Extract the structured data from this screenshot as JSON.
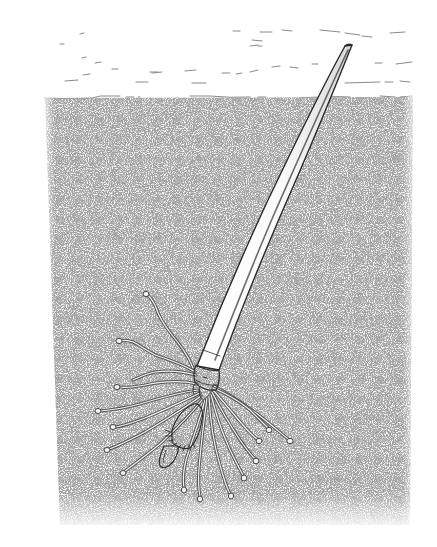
{
  "illustration": {
    "subject": "tube-dwelling worm tube embedded in sediment",
    "style": "pen-and-ink stipple drawing",
    "colors": {
      "background": "#ffffff",
      "ink": "#2e2e2e",
      "stipple": "#6e6e6e",
      "water_lines": "#8a8a8a",
      "tube_fill": "#fbfbfb"
    },
    "regions": {
      "water": {
        "top": 20,
        "bottom": 97
      },
      "sediment": {
        "top": 97,
        "bottom": 525,
        "left_top": 45,
        "left_bottom": 60,
        "right": 413
      }
    },
    "tube": {
      "tip": [
        349,
        45
      ],
      "base": [
        208,
        372
      ],
      "collar_center": [
        205,
        378
      ]
    },
    "tendril_count": 17,
    "elements": [
      "water-surface-dashes",
      "stippled-sediment",
      "long-tapering-tube",
      "tube-collar",
      "root-tendrils-with-bulb-tips",
      "lobed-basal-structure"
    ]
  }
}
